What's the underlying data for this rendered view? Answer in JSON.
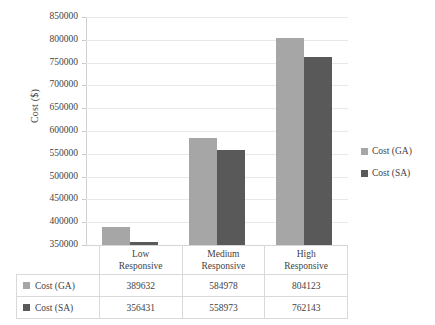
{
  "chart_data": {
    "type": "bar",
    "title": "",
    "subtitle": "",
    "xlabel": "",
    "ylabel": "Cost ($)",
    "ylim": [
      350000,
      850000
    ],
    "ytick_step": 50000,
    "yticks": [
      "850000",
      "800000",
      "750000",
      "700000",
      "650000",
      "600000",
      "550000",
      "500000",
      "450000",
      "400000",
      "350000"
    ],
    "categories": [
      "Low\nResponsive",
      "Medium\nResponsive",
      "High\nResponsive"
    ],
    "category_lines": [
      [
        "Low",
        "Responsive"
      ],
      [
        "Medium",
        "Responsive"
      ],
      [
        "High",
        "Responsive"
      ]
    ],
    "series": [
      {
        "name": "Cost (GA)",
        "color": "#a6a6a6",
        "values": [
          389632,
          584978,
          804123
        ]
      },
      {
        "name": "Cost (SA)",
        "color": "#595959",
        "values": [
          356431,
          558973,
          762143
        ]
      }
    ],
    "grid": true,
    "legend_position": "right",
    "data_table_visible": true
  },
  "legend": {
    "items": [
      {
        "label": "Cost (GA)",
        "color": "#a6a6a6"
      },
      {
        "label": "Cost (SA)",
        "color": "#595959"
      }
    ]
  },
  "table": {
    "corner": "",
    "row_labels": [
      "Cost (GA)",
      "Cost (SA)"
    ],
    "rows": [
      [
        "389632",
        "584978",
        "804123"
      ],
      [
        "356431",
        "558973",
        "762143"
      ]
    ]
  }
}
